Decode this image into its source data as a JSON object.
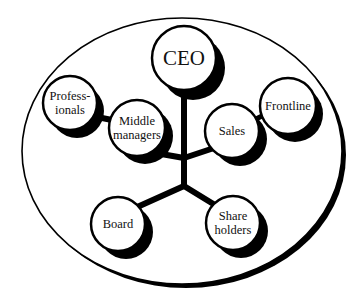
{
  "colors": {
    "ink": "#000000",
    "fill": "#ffffff",
    "text": "#111111"
  },
  "diagram": {
    "type": "organization stakeholder diagram",
    "container": {
      "shape": "ellipse",
      "cx": 182,
      "cy": 151,
      "rx": 160,
      "ry": 133
    },
    "nodes": [
      {
        "id": "ceo",
        "lines": [
          "CEO"
        ],
        "cx": 184,
        "cy": 58,
        "r": 32,
        "size": "big"
      },
      {
        "id": "professionals",
        "lines": [
          "Profess-",
          "ionals"
        ],
        "cx": 70,
        "cy": 103,
        "r": 27,
        "size": "small"
      },
      {
        "id": "middle-managers",
        "lines": [
          "Middle",
          "managers"
        ],
        "cx": 137,
        "cy": 128,
        "r": 28,
        "size": "small"
      },
      {
        "id": "sales",
        "lines": [
          "Sales"
        ],
        "cx": 232,
        "cy": 131,
        "r": 27,
        "size": "small"
      },
      {
        "id": "frontline",
        "lines": [
          "Frontline"
        ],
        "cx": 288,
        "cy": 106,
        "r": 28,
        "size": "small"
      },
      {
        "id": "board",
        "lines": [
          "Board"
        ],
        "cx": 118,
        "cy": 224,
        "r": 27,
        "size": "small"
      },
      {
        "id": "shareholders",
        "lines": [
          "Share",
          "holders"
        ],
        "cx": 233,
        "cy": 223,
        "r": 27,
        "size": "small"
      }
    ]
  },
  "labels": {
    "ceo": "CEO",
    "professionals_1": "Profess-",
    "professionals_2": "ionals",
    "middle_1": "Middle",
    "middle_2": "managers",
    "sales": "Sales",
    "frontline": "Frontline",
    "board": "Board",
    "share_1": "Share",
    "share_2": "holders"
  }
}
